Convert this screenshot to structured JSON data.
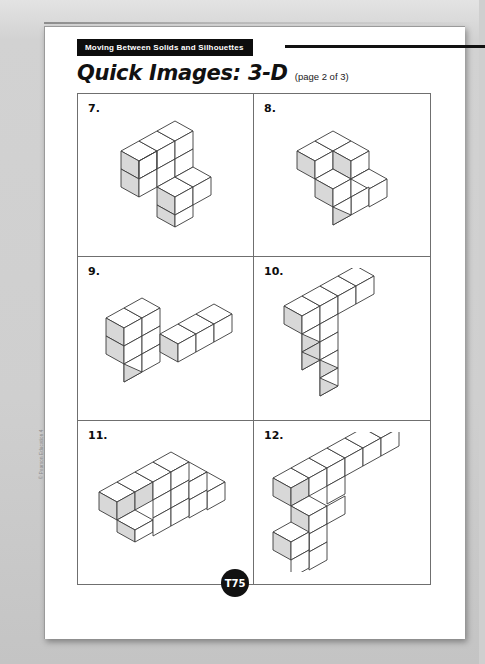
{
  "page": {
    "banner_label": "Moving Between Solids and Silhouettes",
    "title": "Quick Images: 3-D",
    "page_note": "(page 2 of 3)",
    "footer_badge": "T75",
    "copyright": "© Pearson Education 4"
  },
  "colors": {
    "banner_bg": "#0d0d0d",
    "banner_text": "#ffffff",
    "page_bg": "#ffffff",
    "backdrop": "#cfcfcf",
    "rule": "#6f6f6f",
    "cube_top": "#ffffff",
    "cube_left": "#d8d8d8",
    "cube_right": "#ffffff",
    "cube_stroke": "#3a3a3a"
  },
  "problems": [
    {
      "number": "7.",
      "description": "Seven-cube stepped solid: a 3-long by 2-high wall on the upper left joined to a 2-long by 2-high block stepping down to the lower right.",
      "cubes": [
        [
          0,
          0,
          1
        ],
        [
          1,
          0,
          1
        ],
        [
          2,
          0,
          1
        ],
        [
          0,
          0,
          0
        ],
        [
          1,
          0,
          0
        ],
        [
          2,
          0,
          0
        ],
        [
          2,
          1,
          0
        ],
        [
          3,
          1,
          0
        ],
        [
          2,
          1,
          -1
        ],
        [
          3,
          1,
          -1
        ]
      ]
    },
    {
      "number": "8.",
      "description": "Eight-cube corner solid: an upper layer forming an L of three cubes over a lower layer extending right and forward.",
      "cubes": [
        [
          0,
          0,
          1
        ],
        [
          1,
          0,
          1
        ],
        [
          1,
          1,
          1
        ],
        [
          0,
          0,
          0
        ],
        [
          1,
          0,
          0
        ],
        [
          1,
          1,
          0
        ],
        [
          2,
          1,
          0
        ],
        [
          2,
          2,
          0
        ],
        [
          1,
          2,
          0
        ]
      ]
    },
    {
      "number": "9.",
      "description": "Nine-cube solid: a two-high tower of two cubes at the left with a long single-high arm of three cubes running to the lower right.",
      "cubes": [
        [
          0,
          0,
          1
        ],
        [
          1,
          0,
          1
        ],
        [
          0,
          0,
          0
        ],
        [
          1,
          0,
          0
        ],
        [
          0,
          0,
          -1
        ],
        [
          1,
          0,
          -1
        ],
        [
          2,
          1,
          -1
        ],
        [
          3,
          1,
          -1
        ],
        [
          4,
          1,
          -1
        ]
      ]
    },
    {
      "number": "10.",
      "description": "Ten-cube three-armed solid: one arm going upper-left, one arm going upper-right three cubes long, and one column dropping three cubes downward.",
      "cubes": [
        [
          0,
          0,
          1
        ],
        [
          1,
          0,
          1
        ],
        [
          1,
          1,
          1
        ],
        [
          2,
          1,
          1
        ],
        [
          3,
          1,
          1
        ],
        [
          1,
          0,
          0
        ],
        [
          1,
          0,
          -1
        ],
        [
          1,
          0,
          -2
        ]
      ]
    },
    {
      "number": "11.",
      "description": "Eleven-cube wide stepped solid: a long base row with a raised middle block of two cubes and a lower right pair.",
      "cubes": [
        [
          0,
          0,
          0
        ],
        [
          1,
          0,
          0
        ],
        [
          2,
          0,
          0
        ],
        [
          3,
          0,
          0
        ],
        [
          4,
          0,
          0
        ],
        [
          2,
          0,
          1
        ],
        [
          3,
          0,
          1
        ],
        [
          3,
          1,
          0
        ],
        [
          4,
          1,
          0
        ],
        [
          2,
          1,
          0
        ]
      ]
    },
    {
      "number": "12.",
      "description": "Twelve-cube solid: a long four-cube arm to the upper right, a short arm to the left, and a two-cube column dropping down in front.",
      "cubes": [
        [
          0,
          0,
          1
        ],
        [
          1,
          0,
          1
        ],
        [
          1,
          1,
          1
        ],
        [
          2,
          1,
          1
        ],
        [
          3,
          1,
          1
        ],
        [
          4,
          1,
          1
        ],
        [
          1,
          1,
          0
        ],
        [
          2,
          1,
          0
        ],
        [
          1,
          1,
          -1
        ],
        [
          0,
          1,
          -1
        ]
      ]
    }
  ]
}
